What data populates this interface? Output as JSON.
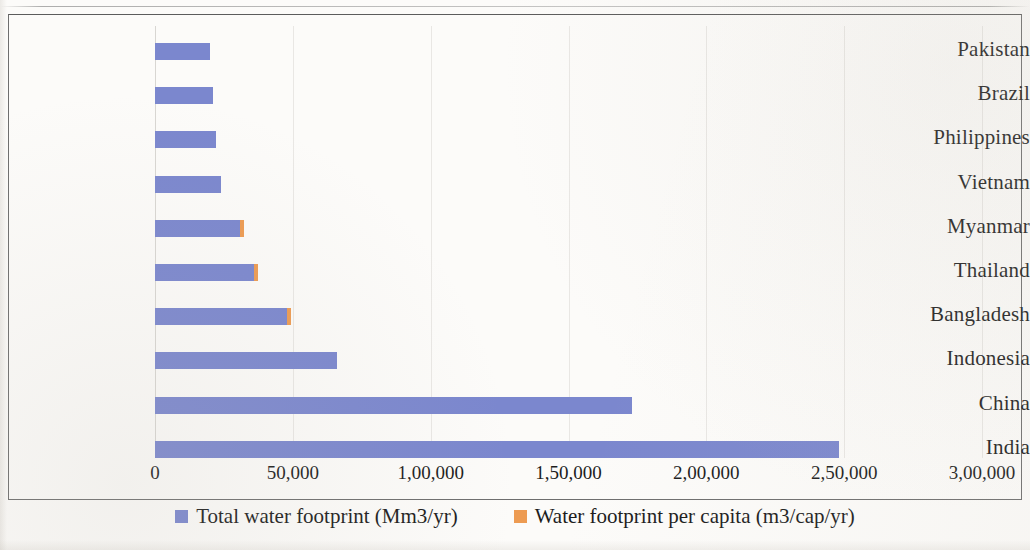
{
  "chart_data": {
    "type": "bar",
    "orientation": "horizontal",
    "stacked": true,
    "title": "",
    "subtitle": "",
    "xlabel": "",
    "ylabel": "",
    "xlim": [
      0,
      300000
    ],
    "grid": true,
    "legend_position": "bottom",
    "categories": [
      "Pakistan",
      "Brazil",
      "Philippines",
      "Vietnam",
      "Myanmar",
      "Thailand",
      "Bangladesh",
      "Indonesia",
      "China",
      "India"
    ],
    "series": [
      {
        "name": "Total water footprint (Mm3/yr)",
        "color": "#7b87ce",
        "values": [
          20000,
          21000,
          22000,
          24000,
          31000,
          36000,
          48000,
          66000,
          173000,
          248000
        ]
      },
      {
        "name": "Water footprint per capita (m3/cap/yr)",
        "color": "#ed9b52",
        "values": [
          0,
          0,
          0,
          0,
          1300,
          1400,
          1200,
          0,
          0,
          0
        ]
      }
    ],
    "x_ticks": [
      0,
      50000,
      100000,
      150000,
      200000,
      250000,
      300000
    ],
    "x_tick_labels": [
      "0",
      "50,000",
      "1,00,000",
      "1,50,000",
      "2,00,000",
      "2,50,000",
      "3,00,000"
    ]
  },
  "legend": {
    "items": [
      {
        "label": "Total water footprint (Mm3/yr)",
        "color": "#7b87ce"
      },
      {
        "label": "Water footprint per capita (m3/cap/yr)",
        "color": "#ed9b52"
      }
    ]
  },
  "colors": {
    "series_total": "#7b87ce",
    "series_per_capita": "#ed9b52",
    "gridline": "#e9e7e4",
    "frame": "#6e6e6e",
    "text": "#1d1d1d",
    "background": "#fcfbf9"
  }
}
